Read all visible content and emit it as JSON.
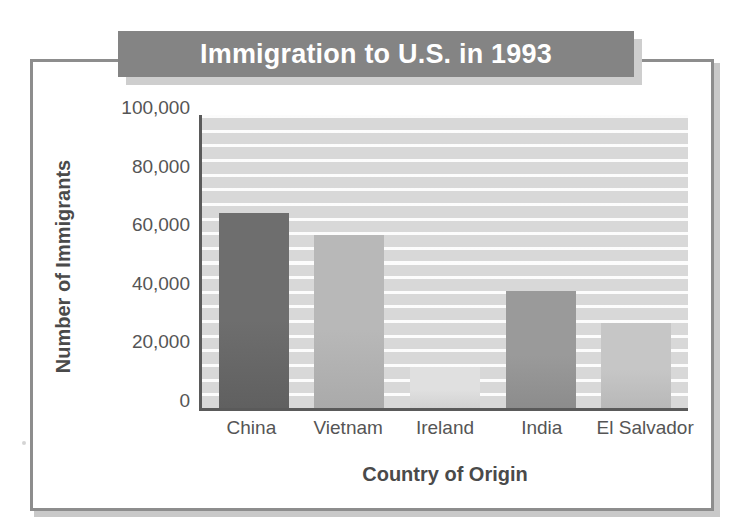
{
  "title": "Immigration to U.S. in 1993",
  "axes": {
    "ylabel": "Number of Immigrants",
    "xlabel": "Country of Origin"
  },
  "colors": {
    "banner": "#848484",
    "banner_text": "#ffffff",
    "frame": "#8d8d8d",
    "axis": "#5a5a5a",
    "plot_background": "#d8d8d8",
    "gridline": "#ffffff",
    "tick_text": "#555555"
  },
  "chart_data": {
    "type": "bar",
    "title": "Immigration to U.S. in 1993",
    "xlabel": "Country of Origin",
    "ylabel": "Number of Immigrants",
    "categories": [
      "China",
      "Vietnam",
      "Ireland",
      "India",
      "El Salvador"
    ],
    "values": [
      66500,
      59000,
      14000,
      40000,
      29000
    ],
    "bar_colors": [
      "#6e6e6e",
      "#b8b8b8",
      "#e0e0e0",
      "#9a9a9a",
      "#c6c6c6"
    ],
    "ylim": [
      0,
      100000
    ],
    "ytick_values": [
      0,
      20000,
      40000,
      60000,
      80000,
      100000
    ],
    "ytick_labels": [
      "0",
      "20,000",
      "40,000",
      "60,000",
      "80,000",
      "100,000"
    ],
    "grid": true,
    "grid_orientation": "horizontal",
    "legend": "none"
  }
}
